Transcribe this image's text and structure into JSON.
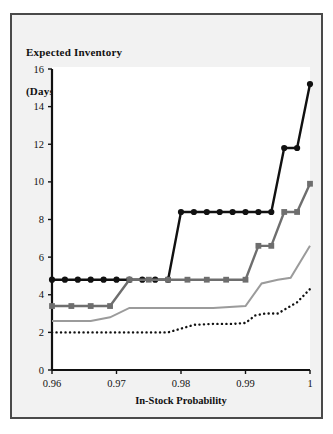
{
  "chart_data": {
    "type": "line",
    "title": "Expected Inventory (Days-of-Demand)",
    "title_lines": [
      "Expected Inventory",
      "(Days-of-Demand)"
    ],
    "xlabel": "In-Stock Probability",
    "ylabel": "Expected Inventory (Days-of-Demand)",
    "xlim": [
      0.96,
      1.0
    ],
    "ylim": [
      0,
      16
    ],
    "xticks": [
      0.96,
      0.97,
      0.98,
      0.99,
      1
    ],
    "xtick_labels": [
      "0.96",
      "0.97",
      "0.98",
      "0.99",
      "1"
    ],
    "yticks": [
      0,
      2,
      4,
      6,
      8,
      10,
      12,
      14,
      16
    ],
    "ytick_labels": [
      "0",
      "2",
      "4",
      "6",
      "8",
      "10",
      "12",
      "14",
      "16"
    ],
    "grid": false,
    "legend_position": "none",
    "plot_bg": "#ffffff",
    "panel_bg": "#f2f2f2",
    "frame_color": "#4a4a4a",
    "axis_color": "#111111",
    "series": [
      {
        "name": "series-black-circles",
        "color": "#111111",
        "marker": "circle",
        "line_style": "solid",
        "line_width": 2.4,
        "x": [
          0.96,
          0.962,
          0.964,
          0.966,
          0.968,
          0.97,
          0.972,
          0.974,
          0.976,
          0.978,
          0.98,
          0.982,
          0.984,
          0.986,
          0.988,
          0.99,
          0.992,
          0.994,
          0.996,
          0.998,
          1.0
        ],
        "y": [
          4.8,
          4.8,
          4.8,
          4.8,
          4.8,
          4.8,
          4.8,
          4.8,
          4.8,
          4.8,
          8.4,
          8.4,
          8.4,
          8.4,
          8.4,
          8.4,
          8.4,
          8.4,
          11.8,
          11.8,
          15.2
        ]
      },
      {
        "name": "series-dark-gray-squares",
        "color": "#6e6e6e",
        "marker": "square",
        "line_style": "solid",
        "line_width": 2.4,
        "x": [
          0.96,
          0.963,
          0.966,
          0.969,
          0.972,
          0.975,
          0.978,
          0.981,
          0.984,
          0.987,
          0.99,
          0.992,
          0.994,
          0.996,
          0.998,
          1.0
        ],
        "y": [
          3.4,
          3.4,
          3.4,
          3.4,
          4.8,
          4.8,
          4.8,
          4.8,
          4.8,
          4.8,
          4.8,
          6.6,
          6.6,
          8.4,
          8.4,
          9.9
        ]
      },
      {
        "name": "series-light-gray-line",
        "color": "#9b9b9b",
        "marker": "none",
        "line_style": "solid",
        "line_width": 2.0,
        "x": [
          0.96,
          0.966,
          0.969,
          0.972,
          0.975,
          0.98,
          0.985,
          0.99,
          0.9925,
          0.995,
          0.997,
          1.0
        ],
        "y": [
          2.6,
          2.6,
          2.8,
          3.3,
          3.3,
          3.3,
          3.3,
          3.4,
          4.6,
          4.8,
          4.9,
          6.6
        ]
      },
      {
        "name": "series-black-dotted",
        "color": "#111111",
        "marker": "none",
        "line_style": "dotted",
        "line_width": 2.4,
        "x": [
          0.96,
          0.968,
          0.974,
          0.978,
          0.98,
          0.982,
          0.985,
          0.988,
          0.99,
          0.9915,
          0.993,
          0.995,
          0.9965,
          0.998,
          1.0
        ],
        "y": [
          2.0,
          2.0,
          2.0,
          2.0,
          2.2,
          2.4,
          2.45,
          2.45,
          2.5,
          2.9,
          3.0,
          3.0,
          3.3,
          3.6,
          4.3
        ]
      }
    ]
  }
}
